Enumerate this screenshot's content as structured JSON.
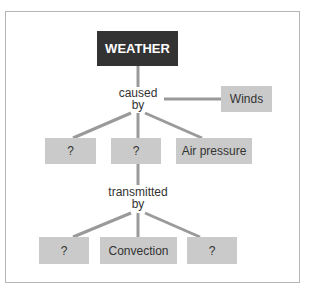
{
  "diagram": {
    "root": {
      "label": "WEATHER"
    },
    "relation1": {
      "line1": "caused",
      "line2": "by"
    },
    "side_node": {
      "label": "Winds"
    },
    "row2": [
      {
        "label": "?"
      },
      {
        "label": "?"
      },
      {
        "label": "Air pressure"
      }
    ],
    "relation2": {
      "line1": "transmitted",
      "line2": "by"
    },
    "row3": [
      {
        "label": "?"
      },
      {
        "label": "Convection"
      },
      {
        "label": "?"
      }
    ],
    "colors": {
      "root_fill": "#333333",
      "node_fill": "#cacaca",
      "line": "#9a9a9a",
      "frame": "#b5b5b5"
    }
  }
}
